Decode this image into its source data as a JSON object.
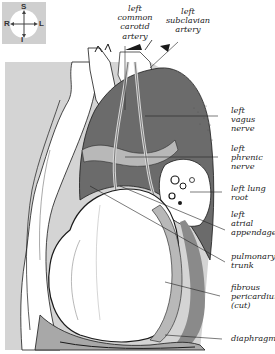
{
  "orientation": {
    "superior": "S",
    "inferior": "I",
    "right": "R",
    "left": "L"
  },
  "labels": {
    "left_common_carotid_artery": "left\ncommon\ncarotid\nartery",
    "left_subclavian_artery": "left\nsubclavian\nartery",
    "left_vagus_nerve": "left\nvagus\nnerve",
    "left_phrenic_nerve": "left\nphrenic\nnerve",
    "left_lung_root": "left lung\nroot",
    "left_atrial_appendage": "left\natrial\nappendage",
    "pulmonary_trunk": "pulmonary\ntrunk",
    "fibrous_pericardium": "fibrous\npericardium\n(cut)",
    "diaphragm": "diaphragm"
  },
  "colors": {
    "panel_gray": "#d4d4d4",
    "dark_tissue": "#6b6b6b",
    "light_tissue": "#b8b8b8",
    "outline": "#1a1a1a",
    "leader_line": "#222222"
  }
}
